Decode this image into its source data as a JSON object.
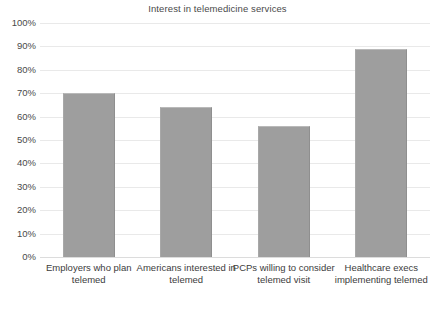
{
  "chart_data": {
    "type": "bar",
    "title": "Interest in telemedicine services",
    "xlabel": "",
    "ylabel": "",
    "ylim": [
      0,
      100
    ],
    "grid": true,
    "legend": "none",
    "value_suffix": "%",
    "categories": [
      "Employers who plan telemed",
      "Americans interested in telemed",
      "PCPs willing to consider telemed visit",
      "Healthcare execs implementing telemed"
    ],
    "values": [
      70,
      64,
      56,
      89
    ],
    "ytick_labels": [
      "100%",
      "90%",
      "80%",
      "70%",
      "60%",
      "50%",
      "40%",
      "30%",
      "20%",
      "10%",
      "0%"
    ],
    "ytick_values": [
      100,
      90,
      80,
      70,
      60,
      50,
      40,
      30,
      20,
      10,
      0
    ],
    "bar_color": "#9e9e9e",
    "grid_color": "#e9e9e9"
  }
}
